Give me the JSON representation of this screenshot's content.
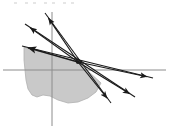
{
  "figure": {
    "title": "",
    "caption": "",
    "background_color": "#ffffff",
    "axis_color": "#8c8c8c",
    "line_color": "#1a1a1a",
    "region_fill_color": "#c9c9c9",
    "region_edge_color": "#b0b0b0",
    "artifact_color": "#e6e6e6"
  },
  "axes": {
    "x_axis": {
      "label": "",
      "y_pixel": 70,
      "x_start": 3,
      "x_end": 166,
      "stroke_width": 1
    },
    "y_axis": {
      "label": "",
      "x_pixel": 52,
      "y_start": 12,
      "y_end": 126,
      "stroke_width": 1
    },
    "origin": {
      "x": 52,
      "y": 70
    },
    "ticks": [],
    "tick_labels": [],
    "grid": false
  },
  "chart_data": {
    "type": "scatter",
    "title": "",
    "xlabel": "",
    "ylabel": "",
    "xlim": [
      0,
      169
    ],
    "ylim": [
      134,
      0
    ],
    "grid": false,
    "legend": "none",
    "annotations": [],
    "vertex_point": {
      "x": 78,
      "y": 62
    },
    "shaded_region": {
      "name": "feasible-region",
      "fill": "#c9c9c9",
      "opacity": 1,
      "path": "M 24,47 L 78,62 L 101,83 L 96,92 L 88,98 L 78,102 L 68,103 L 58,100 L 50,96 L 43,95 L 37,97 L 32,95 L 28,89 L 26,80 L 25,70 L 24,60 Z"
    },
    "rays": [
      {
        "name": "ray-up-right-steep",
        "from": {
          "x": 78,
          "y": 62
        },
        "to": {
          "x": 45,
          "y": 13
        },
        "arrow_at": "to",
        "direction": "up-left"
      },
      {
        "name": "ray-up-left-mid",
        "from": {
          "x": 78,
          "y": 62
        },
        "to": {
          "x": 25,
          "y": 24
        },
        "arrow_at": "to",
        "direction": "up-left"
      },
      {
        "name": "ray-left-shallow",
        "from": {
          "x": 78,
          "y": 62
        },
        "to": {
          "x": 22,
          "y": 46
        },
        "arrow_at": "to",
        "direction": "left"
      },
      {
        "name": "ray-right-shallow",
        "from": {
          "x": 78,
          "y": 62
        },
        "to": {
          "x": 153,
          "y": 78
        },
        "arrow_at": "to",
        "direction": "right"
      },
      {
        "name": "ray-down-right-mid",
        "from": {
          "x": 78,
          "y": 62
        },
        "to": {
          "x": 135,
          "y": 97
        },
        "arrow_at": "to",
        "direction": "down-right"
      },
      {
        "name": "ray-down-right-steep",
        "from": {
          "x": 78,
          "y": 62
        },
        "to": {
          "x": 111,
          "y": 103
        },
        "arrow_at": "to",
        "direction": "down-right"
      }
    ],
    "long_lines": [
      {
        "name": "line-through-vertex-a",
        "from": {
          "x": 45,
          "y": 13
        },
        "to": {
          "x": 111,
          "y": 103
        }
      },
      {
        "name": "line-through-vertex-b",
        "from": {
          "x": 25,
          "y": 24
        },
        "to": {
          "x": 135,
          "y": 97
        }
      },
      {
        "name": "line-through-vertex-c",
        "from": {
          "x": 22,
          "y": 46
        },
        "to": {
          "x": 153,
          "y": 78
        }
      }
    ],
    "scan_artifacts": [
      {
        "x": 14,
        "y": 2
      },
      {
        "x": 25,
        "y": 2
      },
      {
        "x": 33,
        "y": 2
      },
      {
        "x": 44,
        "y": 2
      },
      {
        "x": 52,
        "y": 2
      },
      {
        "x": 63,
        "y": 2
      },
      {
        "x": 71,
        "y": 2
      }
    ]
  }
}
